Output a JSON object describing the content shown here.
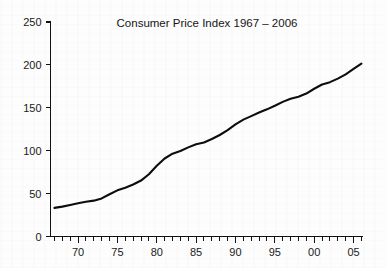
{
  "chart_data": {
    "type": "line",
    "title": "Consumer Price Index 1967 – 2006",
    "xlabel": "",
    "ylabel": "",
    "xlim": [
      1966.5,
      2006.2
    ],
    "ylim": [
      0,
      250
    ],
    "grid": false,
    "legend": null,
    "y_ticks": [
      0,
      50,
      100,
      150,
      200,
      250
    ],
    "y_tick_labels": [
      "0",
      "50",
      "100",
      "150",
      "200",
      "250"
    ],
    "x_ticks": [
      1970,
      1975,
      1980,
      1985,
      1990,
      1995,
      2000,
      2005
    ],
    "x_tick_labels": [
      "70",
      "75",
      "80",
      "85",
      "90",
      "95",
      "00",
      "05"
    ],
    "x_minor_tick_interval": 1,
    "series": [
      {
        "name": "Consumer Price Index",
        "color": "#0d0d0d",
        "x": [
          1967,
          1968,
          1969,
          1970,
          1971,
          1972,
          1973,
          1974,
          1975,
          1976,
          1977,
          1978,
          1979,
          1980,
          1981,
          1982,
          1983,
          1984,
          1985,
          1986,
          1987,
          1988,
          1989,
          1990,
          1991,
          1992,
          1993,
          1994,
          1995,
          1996,
          1997,
          1998,
          1999,
          2000,
          2001,
          2002,
          2003,
          2004,
          2005,
          2006
        ],
        "values": [
          33.4,
          34.8,
          36.7,
          38.8,
          40.5,
          41.8,
          44.4,
          49.3,
          53.8,
          56.9,
          60.6,
          65.2,
          72.6,
          82.4,
          90.9,
          96.5,
          99.6,
          103.9,
          107.6,
          109.6,
          113.6,
          118.3,
          124.0,
          130.7,
          136.2,
          140.3,
          144.5,
          148.2,
          152.4,
          156.9,
          160.5,
          163.0,
          166.6,
          172.2,
          177.1,
          179.9,
          184.0,
          188.9,
          195.3,
          201.6
        ]
      }
    ]
  },
  "chart_meta": {
    "title_text": "Consumer Price Index 1967 – 2006",
    "start_year_label": "1967",
    "end_year_label": "2006",
    "start_value": "33.4",
    "end_value": "201.6"
  }
}
